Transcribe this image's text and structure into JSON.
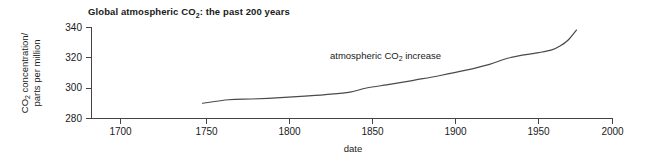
{
  "figure": {
    "title_parts": {
      "pre": "Global atmospheric CO",
      "sub": "2",
      "post": ": the past 200 years"
    },
    "title_full": "Global atmospheric CO2: the past 200 years",
    "background_color": "#ffffff",
    "line_color": "#4a4a4a",
    "text_color": "#1a1a1a"
  },
  "chart_data": {
    "type": "line",
    "title": "Global atmospheric CO2: the past 200 years",
    "xlabel": "date",
    "ylabel": "CO2 concentration/ parts per million",
    "ylabel_parts": {
      "line1_pre": "CO",
      "line1_sub": "2",
      "line1_post": " concentration/",
      "line2": "parts per million"
    },
    "xlim": [
      1700,
      2000
    ],
    "ylim": [
      280,
      340
    ],
    "xticks": [
      1700,
      1750,
      1800,
      1850,
      1900,
      1950,
      2000
    ],
    "xticklabels": [
      "1700",
      "1750",
      "1800",
      "1850",
      "1900",
      "1950",
      "2000"
    ],
    "yticks": [
      280,
      300,
      320,
      340
    ],
    "yticklabels": [
      "280",
      "300",
      "320",
      "340"
    ],
    "grid": false,
    "legend": null,
    "annotations": [
      {
        "text": "atmospheric CO2 increase",
        "text_parts": {
          "pre": "atmospheric CO",
          "sub": "2",
          "post": " increase"
        },
        "x": 1858,
        "y": 316
      }
    ],
    "series": [
      {
        "name": "atmospheric CO2 increase",
        "x": [
          1750,
          1766,
          1780,
          1795,
          1810,
          1825,
          1840,
          1850,
          1865,
          1880,
          1895,
          1910,
          1925,
          1935,
          1945,
          1955,
          1963,
          1968,
          1973,
          1978
        ],
        "values": [
          290.0,
          292.3,
          292.8,
          293.5,
          294.5,
          295.7,
          297.3,
          300.0,
          302.5,
          305.3,
          308.2,
          311.5,
          315.5,
          319.2,
          321.5,
          323.2,
          325.0,
          327.5,
          331.5,
          338.0
        ]
      }
    ]
  }
}
